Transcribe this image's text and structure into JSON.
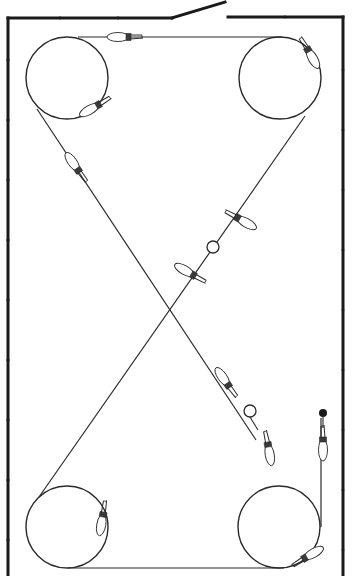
{
  "diagram": {
    "title": "",
    "colors": {
      "background": "#ffffff",
      "wall": "#1a1a1a",
      "line": "#2a2a2a",
      "clip_fill": "#ffffff"
    },
    "enclosure": {
      "left_wall_x": 8,
      "right_wall_x": 343,
      "top_left_segment": {
        "x1": 8,
        "y1": 18,
        "x2": 172,
        "y2": 18
      },
      "door_leaf": {
        "x1": 172,
        "y1": 18,
        "x2": 225,
        "y2": 2
      },
      "top_right_segment": {
        "x1": 228,
        "y1": 17,
        "x2": 343,
        "y2": 17
      },
      "bottom_y": 576
    },
    "pulleys": [
      {
        "name": "top-left",
        "cx": 67,
        "cy": 78,
        "r": 41
      },
      {
        "name": "top-right",
        "cx": 280,
        "cy": 78,
        "r": 41
      },
      {
        "name": "bottom-left",
        "cx": 67,
        "cy": 527,
        "r": 41
      },
      {
        "name": "bottom-right",
        "cx": 279,
        "cy": 527,
        "r": 41
      }
    ],
    "line_segments": [
      {
        "name": "top-span",
        "x1": 78,
        "y1": 37,
        "x2": 282,
        "y2": 37
      },
      {
        "name": "bottom-span",
        "x1": 68,
        "y1": 568,
        "x2": 284,
        "y2": 568
      },
      {
        "name": "diagonal-tl-to-br",
        "x1": 37,
        "y1": 109,
        "x2": 256,
        "y2": 440
      },
      {
        "name": "diagonal-tr-to-bl",
        "x1": 305,
        "y1": 116,
        "x2": 39,
        "y2": 497
      },
      {
        "name": "right-riser",
        "x1": 321,
        "y1": 527,
        "x2": 321,
        "y2": 418
      }
    ],
    "rings": [
      {
        "cx": 213,
        "cy": 247,
        "r": 6
      },
      {
        "cx": 250,
        "cy": 411,
        "r": 6
      }
    ],
    "end_knob": {
      "cx": 323,
      "cy": 413,
      "r": 4
    },
    "clips": [
      {
        "name": "top-span-clip",
        "x": 128,
        "y": 37,
        "angle": 180
      },
      {
        "name": "tl-pulley-clip",
        "x": 98,
        "y": 105,
        "angle": 150
      },
      {
        "name": "tr-pulley-clip",
        "x": 308,
        "y": 50,
        "angle": 60
      },
      {
        "name": "diag-upper-left-clip",
        "x": 78,
        "y": 170,
        "angle": 235
      },
      {
        "name": "diag-mid-upper-clip",
        "x": 238,
        "y": 218,
        "angle": 30
      },
      {
        "name": "diag-mid-lower-clip",
        "x": 193,
        "y": 275,
        "angle": 210
      },
      {
        "name": "diag-lower-clip-a",
        "x": 228,
        "y": 385,
        "angle": 235
      },
      {
        "name": "diag-lower-clip-b",
        "x": 268,
        "y": 445,
        "angle": 80
      },
      {
        "name": "riser-clip",
        "x": 323,
        "y": 440,
        "angle": 90
      },
      {
        "name": "bl-pulley-clip",
        "x": 103,
        "y": 515,
        "angle": 100
      },
      {
        "name": "br-pulley-clip",
        "x": 305,
        "y": 558,
        "angle": 330
      }
    ]
  }
}
